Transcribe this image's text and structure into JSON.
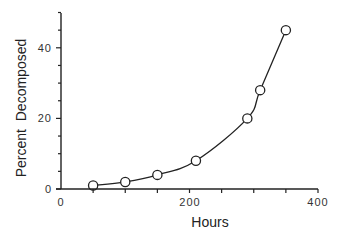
{
  "chart_data": {
    "type": "line",
    "title": "",
    "xlabel": "Hours",
    "ylabel": "Percent  Decomposed",
    "xlim": [
      0,
      400
    ],
    "ylim": [
      0,
      50
    ],
    "x_ticks": [
      0,
      200,
      400
    ],
    "x_minor_ticks": [
      50,
      100,
      150,
      250,
      300,
      350
    ],
    "y_ticks": [
      0,
      20,
      40
    ],
    "y_minor_ticks": [
      5,
      10,
      15,
      25,
      30,
      35,
      45,
      50
    ],
    "grid": false,
    "legend": null,
    "marker": "open-circle",
    "smooth": true,
    "series": [
      {
        "name": "Percent Decomposed",
        "x": [
          50,
          100,
          150,
          210,
          290,
          310,
          350
        ],
        "y": [
          1,
          2,
          4,
          8,
          20,
          28,
          45
        ]
      }
    ]
  },
  "labels": {
    "x_title": "Hours",
    "y_title": "Percent  Decomposed",
    "x_tick_labels": [
      "0",
      "200",
      "400"
    ],
    "y_tick_labels": [
      "0",
      "20",
      "40"
    ]
  }
}
